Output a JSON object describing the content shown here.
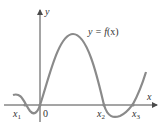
{
  "figure": {
    "function_label_lhs": "y = ",
    "function_label_f": "f",
    "function_label_rest": "(x)",
    "x_axis_label": "x",
    "y_axis_label": "y",
    "origin_label": "0",
    "roots": [
      {
        "base": "x",
        "sub": "1"
      },
      {
        "base": "x",
        "sub": "2"
      },
      {
        "base": "x",
        "sub": "3"
      }
    ],
    "colors": {
      "curve": "#8a8a8a",
      "axis": "#4a4a4a",
      "text": "#333333"
    }
  }
}
